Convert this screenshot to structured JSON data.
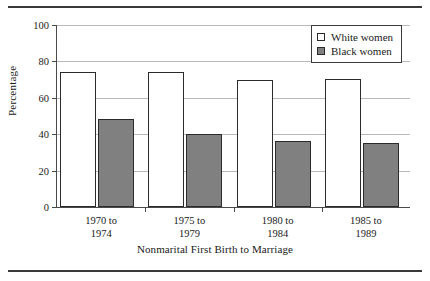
{
  "figure": {
    "top_rule": "horizontal-rule",
    "bottom_rule": "horizontal-rule"
  },
  "chart_data": {
    "type": "bar",
    "title": "",
    "xlabel": "Nonmarital First Birth to Marriage",
    "ylabel": "Percentage",
    "categories": [
      "1970 to\n1974",
      "1975 to\n1979",
      "1980 to\n1984",
      "1985 to\n1989"
    ],
    "category_lines": [
      [
        "1970 to",
        "1974"
      ],
      [
        "1975 to",
        "1979"
      ],
      [
        "1980 to",
        "1984"
      ],
      [
        "1985 to",
        "1989"
      ]
    ],
    "series": [
      {
        "name": "White women",
        "values": [
          74,
          74,
          70,
          70.5
        ],
        "color": "#ffffff"
      },
      {
        "name": "Black women",
        "values": [
          48.5,
          40,
          36,
          35
        ],
        "color": "#808080"
      }
    ],
    "ylim": [
      0,
      100
    ],
    "yticks": [
      0,
      20,
      40,
      60,
      80,
      100
    ],
    "ytick_labels": [
      "0",
      "20",
      "40",
      "60",
      "80",
      "100"
    ],
    "grid": true,
    "legend_position": "top-right"
  },
  "legend": {
    "items": [
      {
        "label": "White women",
        "swatch": "white"
      },
      {
        "label": "Black women",
        "swatch": "gray"
      }
    ]
  },
  "axes": {
    "y_title": "Percentage",
    "x_title": "Nonmarital First Birth to Marriage"
  },
  "colors": {
    "white_bar": "#ffffff",
    "gray_bar": "#808080",
    "bar_outline": "#2b2b2b",
    "gridline": "#b9b9b9",
    "axis": "#4a4a4a",
    "rule": "#3a3a3a"
  }
}
